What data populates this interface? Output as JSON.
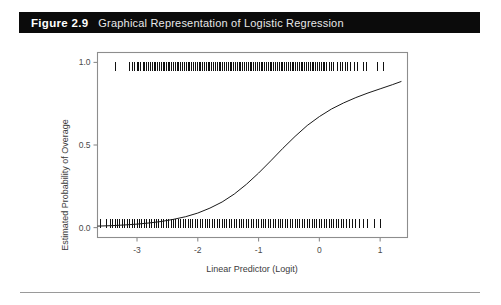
{
  "caption": {
    "number": "Figure 2.9",
    "title": "Graphical Representation of Logistic Regression",
    "bar_color": "#0b0b0b",
    "number_color": "#ffffff",
    "title_color": "#e8e8e8"
  },
  "chart_data": {
    "type": "line",
    "title": "Graphical Representation of Logistic Regression",
    "subtitle": "",
    "xlabel": "Linear Predictor (Logit)",
    "ylabel": "Estimated Probability of Overage",
    "xlim": [
      -3.65,
      1.45
    ],
    "ylim": [
      -0.06,
      1.06
    ],
    "xticks": [
      -3,
      -2,
      -1,
      0,
      1
    ],
    "xticklabels": [
      "-3",
      "-2",
      "-1",
      "0",
      "1"
    ],
    "yticks": [
      0.0,
      0.5,
      1.0
    ],
    "yticklabels": [
      "0.0",
      "0.5",
      "1.0"
    ],
    "grid": false,
    "legend": "none",
    "curve_color": "#1a1a1a",
    "series": [
      {
        "name": "Fitted logistic curve",
        "x": [
          -3.65,
          -3.4,
          -3.2,
          -3.0,
          -2.8,
          -2.6,
          -2.4,
          -2.2,
          -2.0,
          -1.8,
          -1.6,
          -1.4,
          -1.2,
          -1.0,
          -0.8,
          -0.6,
          -0.4,
          -0.2,
          0.0,
          0.2,
          0.4,
          0.6,
          0.8,
          1.0,
          1.2,
          1.35
        ],
        "y": [
          0.009,
          0.012,
          0.016,
          0.021,
          0.028,
          0.037,
          0.05,
          0.066,
          0.088,
          0.118,
          0.155,
          0.203,
          0.262,
          0.33,
          0.404,
          0.48,
          0.552,
          0.618,
          0.672,
          0.718,
          0.755,
          0.787,
          0.815,
          0.84,
          0.865,
          0.885
        ]
      }
    ],
    "rug_top": {
      "name": "Observations with outcome = 1",
      "y_value": 1.0,
      "values": [
        -3.36,
        -3.12,
        -3.08,
        -3.04,
        -3.0,
        -2.97,
        -2.94,
        -2.9,
        -2.87,
        -2.84,
        -2.81,
        -2.78,
        -2.75,
        -2.72,
        -2.69,
        -2.66,
        -2.63,
        -2.6,
        -2.57,
        -2.55,
        -2.52,
        -2.49,
        -2.46,
        -2.43,
        -2.4,
        -2.37,
        -2.34,
        -2.31,
        -2.28,
        -2.25,
        -2.22,
        -2.19,
        -2.16,
        -2.13,
        -2.1,
        -2.07,
        -2.04,
        -2.01,
        -1.98,
        -1.95,
        -1.92,
        -1.89,
        -1.86,
        -1.83,
        -1.8,
        -1.77,
        -1.74,
        -1.71,
        -1.68,
        -1.65,
        -1.62,
        -1.59,
        -1.56,
        -1.53,
        -1.5,
        -1.47,
        -1.44,
        -1.41,
        -1.38,
        -1.35,
        -1.32,
        -1.29,
        -1.26,
        -1.23,
        -1.2,
        -1.17,
        -1.14,
        -1.11,
        -1.08,
        -1.05,
        -1.02,
        -0.99,
        -0.96,
        -0.93,
        -0.9,
        -0.87,
        -0.84,
        -0.81,
        -0.78,
        -0.75,
        -0.72,
        -0.69,
        -0.66,
        -0.63,
        -0.6,
        -0.57,
        -0.54,
        -0.51,
        -0.48,
        -0.45,
        -0.42,
        -0.39,
        -0.36,
        -0.33,
        -0.3,
        -0.27,
        -0.24,
        -0.21,
        -0.18,
        -0.15,
        -0.12,
        -0.09,
        -0.06,
        -0.03,
        0.0,
        0.03,
        0.06,
        0.09,
        0.12,
        0.16,
        0.2,
        0.24,
        0.3,
        0.34,
        0.38,
        0.43,
        0.47,
        0.52,
        0.58,
        0.62,
        0.72,
        0.78,
        0.95,
        1.05
      ]
    },
    "rug_bottom": {
      "name": "Observations with outcome = 0",
      "y_value": 0.0,
      "values": [
        -3.6,
        -3.5,
        -3.44,
        -3.4,
        -3.36,
        -3.32,
        -3.28,
        -3.24,
        -3.2,
        -3.16,
        -3.12,
        -3.08,
        -3.04,
        -3.0,
        -2.96,
        -2.92,
        -2.88,
        -2.84,
        -2.8,
        -2.76,
        -2.72,
        -2.68,
        -2.64,
        -2.6,
        -2.56,
        -2.52,
        -2.48,
        -2.44,
        -2.4,
        -2.36,
        -2.32,
        -2.28,
        -2.24,
        -2.2,
        -2.16,
        -2.12,
        -2.08,
        -2.04,
        -2.0,
        -1.96,
        -1.92,
        -1.88,
        -1.84,
        -1.8,
        -1.76,
        -1.72,
        -1.68,
        -1.64,
        -1.6,
        -1.56,
        -1.52,
        -1.48,
        -1.44,
        -1.4,
        -1.36,
        -1.32,
        -1.28,
        -1.24,
        -1.2,
        -1.16,
        -1.12,
        -1.08,
        -1.04,
        -1.0,
        -0.96,
        -0.92,
        -0.88,
        -0.84,
        -0.8,
        -0.76,
        -0.72,
        -0.68,
        -0.64,
        -0.6,
        -0.56,
        -0.52,
        -0.48,
        -0.44,
        -0.4,
        -0.36,
        -0.32,
        -0.28,
        -0.24,
        -0.2,
        -0.16,
        -0.12,
        -0.08,
        -0.04,
        0.0,
        0.04,
        0.08,
        0.12,
        0.16,
        0.2,
        0.24,
        0.28,
        0.32,
        0.36,
        0.4,
        0.45,
        0.5,
        0.55,
        0.6,
        0.66,
        0.72,
        0.8,
        0.9,
        1.0
      ]
    }
  }
}
